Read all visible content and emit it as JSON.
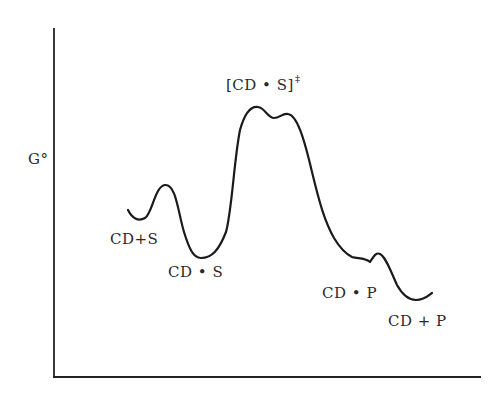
{
  "diagram": {
    "type": "free-energy reaction coordinate diagram",
    "y_axis_label": "G°",
    "x_axis_label": "",
    "transition_state": {
      "label": "[CD • S]",
      "superscript": "‡"
    },
    "states": [
      {
        "id": "reactants",
        "label": "CD+S"
      },
      {
        "id": "complex_substrate",
        "label": "CD • S"
      },
      {
        "id": "transition_state",
        "label": "[CD • S]‡"
      },
      {
        "id": "complex_product",
        "label": "CD • P"
      },
      {
        "id": "products",
        "label": "CD + P"
      }
    ],
    "colors": {
      "line": "#222222",
      "background": "#ffffff"
    }
  },
  "labels": {
    "g_axis": "G°",
    "ts_main": "[CD • S]",
    "ts_sup": "‡",
    "reactants": "CD+S",
    "cds": "CD • S",
    "cdp": "CD • P",
    "products": "CD + P"
  }
}
